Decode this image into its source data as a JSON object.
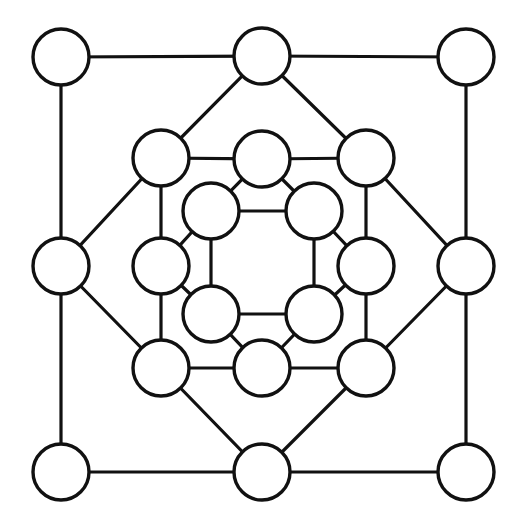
{
  "diagram": {
    "type": "graph",
    "colors": {
      "stroke": "#111111",
      "node_fill": "#ffffff",
      "background": "#ffffff"
    },
    "node_radius": 28,
    "nodes": [
      {
        "id": "o_tl",
        "ring": "outer",
        "x": 61,
        "y": 57
      },
      {
        "id": "o_tm",
        "ring": "outer",
        "x": 262,
        "y": 56
      },
      {
        "id": "o_tr",
        "ring": "outer",
        "x": 466,
        "y": 57
      },
      {
        "id": "o_ml",
        "ring": "outer",
        "x": 61,
        "y": 266
      },
      {
        "id": "o_mr",
        "ring": "outer",
        "x": 466,
        "y": 266
      },
      {
        "id": "o_bl",
        "ring": "outer",
        "x": 61,
        "y": 472
      },
      {
        "id": "o_bm",
        "ring": "outer",
        "x": 262,
        "y": 472
      },
      {
        "id": "o_br",
        "ring": "outer",
        "x": 466,
        "y": 472
      },
      {
        "id": "m_tl",
        "ring": "middle",
        "x": 161,
        "y": 158
      },
      {
        "id": "m_tm",
        "ring": "middle",
        "x": 262,
        "y": 159
      },
      {
        "id": "m_tr",
        "ring": "middle",
        "x": 366,
        "y": 158
      },
      {
        "id": "m_ml",
        "ring": "middle",
        "x": 161,
        "y": 266
      },
      {
        "id": "m_mr",
        "ring": "middle",
        "x": 366,
        "y": 266
      },
      {
        "id": "m_bl",
        "ring": "middle",
        "x": 161,
        "y": 368
      },
      {
        "id": "m_bm",
        "ring": "middle",
        "x": 262,
        "y": 368
      },
      {
        "id": "m_br",
        "ring": "middle",
        "x": 366,
        "y": 368
      },
      {
        "id": "i_tl",
        "ring": "inner",
        "x": 211,
        "y": 211
      },
      {
        "id": "i_tr",
        "ring": "inner",
        "x": 314,
        "y": 211
      },
      {
        "id": "i_bl",
        "ring": "inner",
        "x": 211,
        "y": 314
      },
      {
        "id": "i_br",
        "ring": "inner",
        "x": 314,
        "y": 314
      }
    ],
    "edges": [
      [
        "o_tl",
        "o_tm"
      ],
      [
        "o_tm",
        "o_tr"
      ],
      [
        "o_tr",
        "o_mr"
      ],
      [
        "o_mr",
        "o_br"
      ],
      [
        "o_br",
        "o_bm"
      ],
      [
        "o_bm",
        "o_bl"
      ],
      [
        "o_bl",
        "o_ml"
      ],
      [
        "o_ml",
        "o_tl"
      ],
      [
        "o_tm",
        "m_tl"
      ],
      [
        "o_tm",
        "m_tr"
      ],
      [
        "o_mr",
        "m_tr"
      ],
      [
        "o_mr",
        "m_br"
      ],
      [
        "o_bm",
        "m_bl"
      ],
      [
        "o_bm",
        "m_br"
      ],
      [
        "o_ml",
        "m_tl"
      ],
      [
        "o_ml",
        "m_bl"
      ],
      [
        "m_tl",
        "m_tm"
      ],
      [
        "m_tm",
        "m_tr"
      ],
      [
        "m_tr",
        "m_mr"
      ],
      [
        "m_mr",
        "m_br"
      ],
      [
        "m_br",
        "m_bm"
      ],
      [
        "m_bm",
        "m_bl"
      ],
      [
        "m_bl",
        "m_ml"
      ],
      [
        "m_ml",
        "m_tl"
      ],
      [
        "i_tl",
        "m_tm"
      ],
      [
        "i_tl",
        "m_ml"
      ],
      [
        "i_tr",
        "m_tm"
      ],
      [
        "i_tr",
        "m_mr"
      ],
      [
        "i_bl",
        "m_bm"
      ],
      [
        "i_bl",
        "m_ml"
      ],
      [
        "i_br",
        "m_bm"
      ],
      [
        "i_br",
        "m_mr"
      ],
      [
        "i_tl",
        "i_tr"
      ],
      [
        "i_tr",
        "i_br"
      ],
      [
        "i_br",
        "i_bl"
      ],
      [
        "i_bl",
        "i_tl"
      ]
    ]
  }
}
